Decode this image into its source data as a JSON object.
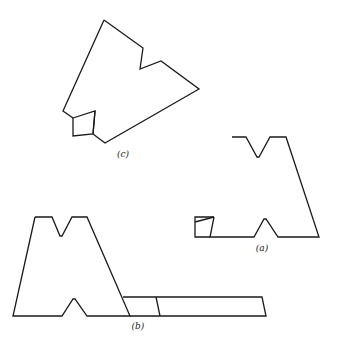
{
  "figure": {
    "stroke_color": "#1a1a1a",
    "background": "#ffffff",
    "panels": [
      {
        "id": "c",
        "label": "(c)",
        "label_pos": [
          123,
          157
        ],
        "outline": [
          [
            104,
            20
          ],
          [
            143,
            48
          ],
          [
            140,
            69
          ],
          [
            161,
            61
          ],
          [
            199,
            89
          ],
          [
            105,
            143
          ],
          [
            93,
            134
          ],
          [
            95,
            111
          ]
        ],
        "outline_left": [
          [
            104,
            20
          ],
          [
            63,
            111
          ],
          [
            73,
            118
          ]
        ],
        "square": [
          [
            73,
            118
          ],
          [
            95,
            111
          ],
          [
            93,
            134
          ],
          [
            73,
            136
          ]
        ]
      },
      {
        "id": "a",
        "label": "(a)",
        "label_pos": [
          262,
          251
        ],
        "outline": [
          [
            232,
            137
          ],
          [
            246,
            137
          ],
          [
            257,
            157
          ],
          [
            259,
            157
          ],
          [
            270,
            137
          ],
          [
            286,
            137
          ],
          [
            319,
            237
          ],
          [
            278,
            237
          ],
          [
            266,
            219
          ],
          [
            264,
            219
          ],
          [
            254,
            237
          ],
          [
            210,
            237
          ],
          [
            214,
            217
          ]
        ],
        "box": [
          [
            214,
            217
          ],
          [
            195,
            217
          ],
          [
            195,
            237
          ],
          [
            210,
            237
          ]
        ],
        "box_diagonal": [
          [
            195,
            222
          ],
          [
            214,
            217
          ]
        ]
      },
      {
        "id": "b",
        "label": "(b)",
        "label_pos": [
          138,
          329
        ],
        "outline": [
          [
            35,
            217
          ],
          [
            52,
            217
          ],
          [
            60,
            236
          ],
          [
            62,
            236
          ],
          [
            72,
            217
          ],
          [
            87,
            217
          ],
          [
            130,
            316
          ],
          [
            87,
            316
          ],
          [
            75,
            299
          ],
          [
            73,
            299
          ],
          [
            62,
            316
          ],
          [
            13,
            316
          ],
          [
            35,
            217
          ]
        ],
        "rect": [
          [
            123,
            297
          ],
          [
            262,
            297
          ],
          [
            266,
            316
          ],
          [
            130,
            316
          ]
        ],
        "rect_divider": [
          [
            156,
            297
          ],
          [
            160,
            316
          ]
        ]
      }
    ]
  }
}
